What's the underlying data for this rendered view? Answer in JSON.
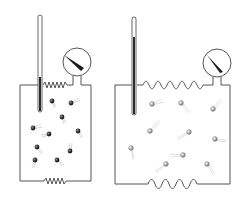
{
  "diagram": {
    "colors": {
      "line": "#555555",
      "molecule_cold": "#333333",
      "molecule_hot": "#9a9a9a",
      "mercury": "#2b2b2b",
      "background": "#ffffff"
    },
    "panels": [
      {
        "id": "left",
        "box": {
          "x1": 20,
          "y1": 85,
          "x2": 91,
          "y2": 181
        },
        "thermometer": {
          "x": 40,
          "top": 15,
          "bottom": 112,
          "fill_top": 77
        },
        "gauge": {
          "cx": 77,
          "cy": 62,
          "r": 14
        },
        "molecule_count": 10,
        "molecules": [
          [
            52,
            101
          ],
          [
            71,
            103
          ],
          [
            62,
            117
          ],
          [
            33,
            128
          ],
          [
            49,
            134
          ],
          [
            78,
            131
          ],
          [
            37,
            147
          ],
          [
            70,
            151
          ],
          [
            35,
            160
          ],
          [
            57,
            160
          ]
        ]
      },
      {
        "id": "right",
        "box": {
          "x1": 115,
          "y1": 85,
          "x2": 230,
          "y2": 184
        },
        "thermometer": {
          "x": 134,
          "top": 17,
          "bottom": 115,
          "fill_top": 37
        },
        "gauge": {
          "cx": 217,
          "cy": 63,
          "r": 14
        },
        "molecule_count": 11,
        "molecules": [
          [
            152,
            104
          ],
          [
            181,
            103
          ],
          [
            213,
            109
          ],
          [
            150,
            131
          ],
          [
            189,
            132
          ],
          [
            215,
            139
          ],
          [
            131,
            148
          ],
          [
            183,
            155
          ],
          [
            166,
            164
          ],
          [
            207,
            164
          ],
          [
            144,
            146
          ]
        ]
      }
    ]
  }
}
